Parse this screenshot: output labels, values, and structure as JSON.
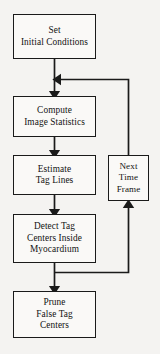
{
  "diagram": {
    "type": "flowchart",
    "background_color": "#f4f3f1",
    "line_color": "#1a1a1a",
    "node_fill_color": "#faf9f7",
    "nodes": [
      {
        "id": "set-initial-conditions",
        "label": "Set\nInitial Conditions"
      },
      {
        "id": "compute-image-statistics",
        "label": "Compute\nImage Statistics"
      },
      {
        "id": "estimate-tag-lines",
        "label": "Estimate\nTag Lines"
      },
      {
        "id": "detect-tag-centers",
        "label": "Detect Tag\nCenters Inside\nMyocardium"
      },
      {
        "id": "prune-false-tag-centers",
        "label": "Prune\nFalse Tag\nCenters"
      },
      {
        "id": "next-time-frame",
        "label": "Next\nTime\nFrame"
      }
    ],
    "edges": [
      {
        "from": "set-initial-conditions",
        "to": "compute-image-statistics"
      },
      {
        "from": "compute-image-statistics",
        "to": "estimate-tag-lines"
      },
      {
        "from": "estimate-tag-lines",
        "to": "detect-tag-centers"
      },
      {
        "from": "detect-tag-centers",
        "to": "prune-false-tag-centers"
      },
      {
        "from": "detect-tag-centers",
        "to": "next-time-frame"
      },
      {
        "from": "next-time-frame",
        "to": "compute-image-statistics"
      }
    ]
  }
}
